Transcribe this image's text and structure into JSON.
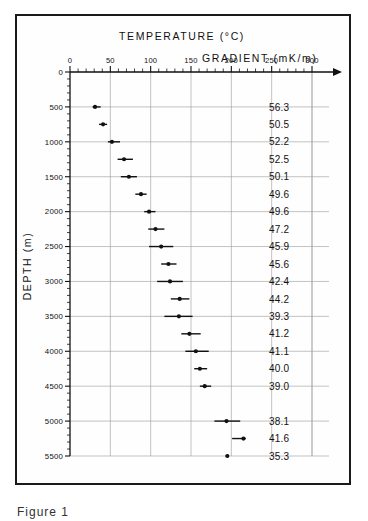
{
  "figure": {
    "caption": "Figure 1"
  },
  "chart_data": {
    "type": "scatter",
    "title": "TEMPERATURE (°C)",
    "xlabel": "TEMPERATURE (°C)",
    "ylabel": "DEPTH (m)",
    "secondary_axis_label": "GRADIENT (mK/m)",
    "orientation": "x-top-y-inverted",
    "xlim": [
      0,
      300
    ],
    "ylim": [
      0,
      5500
    ],
    "x_major_step": 50,
    "x_minor_step": 10,
    "y_major_step": 500,
    "y_minor_step": 100,
    "grid": true,
    "legend": "none",
    "x_ticks": [
      0,
      50,
      100,
      150,
      200,
      250,
      300
    ],
    "y_ticks": [
      0,
      500,
      1000,
      1500,
      2000,
      2500,
      3000,
      3500,
      4000,
      4500,
      5000,
      5500
    ],
    "points": [
      {
        "depth": 500,
        "temperature": 31,
        "err_low": 28,
        "err_high": 38,
        "gradient": "56.3"
      },
      {
        "depth": 750,
        "temperature": 41,
        "err_low": 36,
        "err_high": 46,
        "gradient": "50.5"
      },
      {
        "depth": 1000,
        "temperature": 52,
        "err_low": 47,
        "err_high": 62,
        "gradient": "52.2"
      },
      {
        "depth": 1250,
        "temperature": 67,
        "err_low": 59,
        "err_high": 78,
        "gradient": "52.5"
      },
      {
        "depth": 1500,
        "temperature": 73,
        "err_low": 63,
        "err_high": 83,
        "gradient": "50.1"
      },
      {
        "depth": 1750,
        "temperature": 88,
        "err_low": 81,
        "err_high": 95,
        "gradient": "49.6"
      },
      {
        "depth": 2000,
        "temperature": 98,
        "err_low": 92,
        "err_high": 106,
        "gradient": "49.6"
      },
      {
        "depth": 2250,
        "temperature": 106,
        "err_low": 97,
        "err_high": 117,
        "gradient": "47.2"
      },
      {
        "depth": 2500,
        "temperature": 113,
        "err_low": 98,
        "err_high": 128,
        "gradient": "45.9"
      },
      {
        "depth": 2750,
        "temperature": 122,
        "err_low": 113,
        "err_high": 132,
        "gradient": "45.6"
      },
      {
        "depth": 3000,
        "temperature": 124,
        "err_low": 108,
        "err_high": 140,
        "gradient": "42.4"
      },
      {
        "depth": 3250,
        "temperature": 136,
        "err_low": 125,
        "err_high": 148,
        "gradient": "44.2"
      },
      {
        "depth": 3500,
        "temperature": 135,
        "err_low": 117,
        "err_high": 152,
        "gradient": "39.3"
      },
      {
        "depth": 3750,
        "temperature": 148,
        "err_low": 138,
        "err_high": 162,
        "gradient": "41.2"
      },
      {
        "depth": 4000,
        "temperature": 156,
        "err_low": 143,
        "err_high": 172,
        "gradient": "41.1"
      },
      {
        "depth": 4250,
        "temperature": 161,
        "err_low": 154,
        "err_high": 170,
        "gradient": "40.0"
      },
      {
        "depth": 4500,
        "temperature": 167,
        "err_low": 161,
        "err_high": 175,
        "gradient": "39.0"
      },
      {
        "depth": 5000,
        "temperature": 194,
        "err_low": 179,
        "err_high": 211,
        "gradient": "38.1"
      },
      {
        "depth": 5250,
        "temperature": 215,
        "err_low": 201,
        "err_high": 218,
        "gradient": "41.6"
      },
      {
        "depth": 5500,
        "temperature": 195,
        "err_low": 195,
        "err_high": 195,
        "gradient": "35.3"
      }
    ]
  }
}
